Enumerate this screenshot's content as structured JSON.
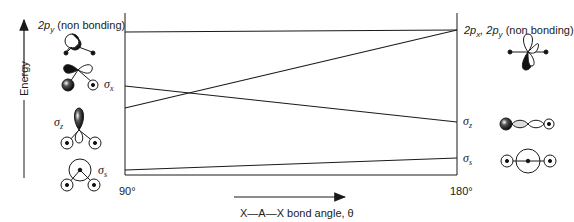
{
  "diagram": {
    "y_axis": {
      "label": "Energy"
    },
    "x_axis": {
      "label": "X—A—X bond angle, θ",
      "left_tick": "90°",
      "right_tick": "180°"
    },
    "left_levels": [
      {
        "id": "2py_nb_bent",
        "label_main": "2p",
        "label_sub": "y",
        "label_suffix": " (non bonding)"
      },
      {
        "id": "sigma_x",
        "label_main": "σ",
        "label_sub": "x"
      },
      {
        "id": "sigma_z_bent",
        "label_main": "σ",
        "label_sub": "z"
      },
      {
        "id": "sigma_s_bent",
        "label_main": "σ",
        "label_sub": "s"
      }
    ],
    "right_levels": [
      {
        "id": "2px_2py_nb_linear",
        "label_main": "2p",
        "label_sub": "x",
        "label_mid": ", 2p",
        "label_sub2": "y",
        "label_suffix": " (non bonding)"
      },
      {
        "id": "sigma_z_linear",
        "label_main": "σ",
        "label_sub": "z"
      },
      {
        "id": "sigma_s_linear",
        "label_main": "σ",
        "label_sub": "s"
      }
    ],
    "correlation_lines": [
      {
        "from": "2p_y (non bonding) 90°",
        "to": "2p_x, 2p_y (non bonding) 180°",
        "y_left": 32,
        "y_right": 30
      },
      {
        "from": "lower level 90° (σ_z)",
        "to": "2p_x, 2p_y (non bonding) 180°",
        "y_left": 108,
        "y_right": 30
      },
      {
        "from": "σ_x 90°",
        "to": "σ_z 180°",
        "y_left": 86,
        "y_right": 122
      },
      {
        "from": "σ_s 90°",
        "to": "σ_s 180°",
        "y_left": 170,
        "y_right": 158
      }
    ]
  }
}
